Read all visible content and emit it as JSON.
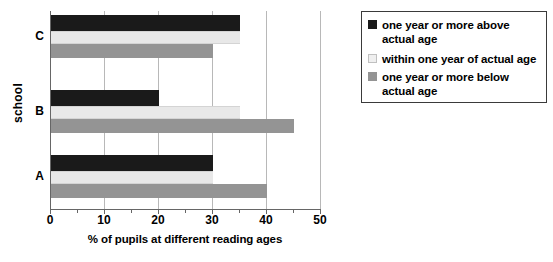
{
  "chart_data": {
    "type": "bar",
    "orientation": "horizontal",
    "title": "",
    "xlabel": "% of pupils at different reading ages",
    "ylabel": "school",
    "categories": [
      "A",
      "B",
      "C"
    ],
    "xlim": [
      0,
      50
    ],
    "xticks": [
      0,
      10,
      20,
      30,
      40,
      50
    ],
    "xtick_labels": [
      "0",
      "10",
      "20",
      "30",
      "40",
      "50"
    ],
    "minor_tick_interval": 5,
    "grid": true,
    "grid_axis": "x",
    "legend_position": "right",
    "series": [
      {
        "name": "one year or more above actual age",
        "color": "#1a1a1a",
        "values": [
          30,
          20,
          35
        ]
      },
      {
        "name": "within one year of actual age",
        "color": "#e8e8e8",
        "values": [
          30,
          35,
          35
        ]
      },
      {
        "name": "one year or more below actual age",
        "color": "#949494",
        "values": [
          40,
          45,
          30
        ]
      }
    ]
  },
  "axes": {
    "y_title": "school",
    "x_title": "% of pupils at different reading ages",
    "x_tick_labels": [
      "0",
      "10",
      "20",
      "30",
      "40",
      "50"
    ],
    "category_labels": {
      "A": "A",
      "B": "B",
      "C": "C"
    }
  },
  "legend": {
    "items": [
      {
        "label_line1": "one year or more above",
        "label_line2": "actual age",
        "swatch": "black-square-icon",
        "color": "#1a1a1a"
      },
      {
        "label_line1": "within one year of actual age",
        "label_line2": "",
        "swatch": "light-gray-square-icon",
        "color": "#e8e8e8"
      },
      {
        "label_line1": "one year or more below",
        "label_line2": "actual age",
        "swatch": "gray-square-icon",
        "color": "#949494"
      }
    ]
  }
}
